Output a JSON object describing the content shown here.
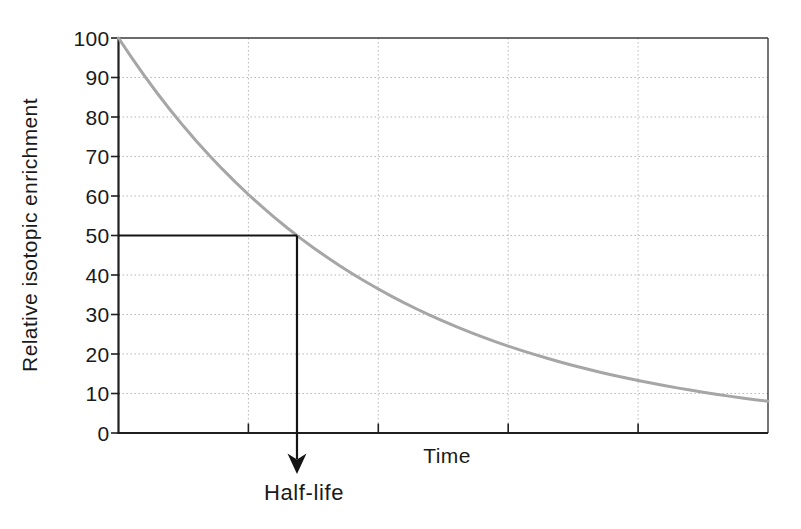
{
  "page": {
    "background_color": "#ffffff"
  },
  "colors": {
    "axis": "#1f1f1f",
    "frame": "#3a3a3a",
    "grid": "#b9b9b9",
    "curve": "#a6a6a6",
    "annotation": "#141414",
    "text": "#1a1a1a"
  },
  "chart_data": {
    "type": "line",
    "title": "",
    "xlabel": "Time",
    "ylabel": "Relative isotopic enrichment",
    "xlim": [
      0,
      5
    ],
    "ylim": [
      0,
      100
    ],
    "grid": true,
    "legend": false,
    "x_ticks": [
      1,
      2,
      3,
      4
    ],
    "x_tick_labels": [],
    "y_ticks": [
      0,
      10,
      20,
      30,
      40,
      50,
      60,
      70,
      80,
      90,
      100
    ],
    "y_tick_labels": [
      "0",
      "10",
      "20",
      "30",
      "40",
      "50",
      "60",
      "70",
      "80",
      "90",
      "100"
    ],
    "series": [
      {
        "name": "isotopic-decay",
        "color": "#a6a6a6",
        "points": [
          [
            0.0,
            100.0
          ],
          [
            0.1,
            95.08
          ],
          [
            0.2,
            90.4
          ],
          [
            0.3,
            85.95
          ],
          [
            0.4,
            81.72
          ],
          [
            0.5,
            77.7
          ],
          [
            0.6,
            73.88
          ],
          [
            0.7,
            70.24
          ],
          [
            0.8,
            66.79
          ],
          [
            0.9,
            63.5
          ],
          [
            1.0,
            60.38
          ],
          [
            1.1,
            57.41
          ],
          [
            1.2,
            54.58
          ],
          [
            1.3,
            51.9
          ],
          [
            1.4,
            49.34
          ],
          [
            1.5,
            46.92
          ],
          [
            1.6,
            44.61
          ],
          [
            1.7,
            42.41
          ],
          [
            1.8,
            40.33
          ],
          [
            1.9,
            38.34
          ],
          [
            2.0,
            36.46
          ],
          [
            2.1,
            34.66
          ],
          [
            2.2,
            32.96
          ],
          [
            2.3,
            31.33
          ],
          [
            2.4,
            29.79
          ],
          [
            2.5,
            28.33
          ],
          [
            2.6,
            26.93
          ],
          [
            2.7,
            25.61
          ],
          [
            2.8,
            24.35
          ],
          [
            2.9,
            23.15
          ],
          [
            3.0,
            22.01
          ],
          [
            3.1,
            20.93
          ],
          [
            3.2,
            19.9
          ],
          [
            3.3,
            18.92
          ],
          [
            3.4,
            17.99
          ],
          [
            3.5,
            17.1
          ],
          [
            3.6,
            16.26
          ],
          [
            3.7,
            15.46
          ],
          [
            3.8,
            14.7
          ],
          [
            3.9,
            13.98
          ],
          [
            4.0,
            13.29
          ],
          [
            4.1,
            12.64
          ],
          [
            4.2,
            12.01
          ],
          [
            4.3,
            11.42
          ],
          [
            4.4,
            10.86
          ],
          [
            4.5,
            10.33
          ],
          [
            4.6,
            9.82
          ],
          [
            4.7,
            9.34
          ],
          [
            4.8,
            8.88
          ],
          [
            4.9,
            8.44
          ],
          [
            5.0,
            8.03
          ]
        ]
      }
    ],
    "annotation": {
      "label": "Half-life",
      "x": 1.374,
      "y": 50
    }
  }
}
